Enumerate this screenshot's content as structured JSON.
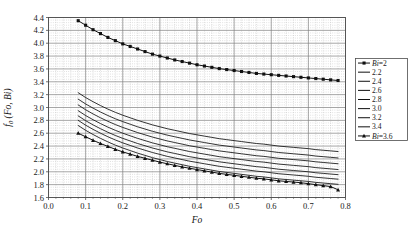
{
  "chart_data": {
    "type": "line",
    "title": "",
    "xlabel": "Fo",
    "ylabel": "f0 (Fo, Bi)",
    "xlim": [
      0.0,
      0.8
    ],
    "ylim": [
      1.6,
      4.4
    ],
    "xticks": [
      "0.0",
      "0.1",
      "0.2",
      "0.3",
      "0.4",
      "0.5",
      "0.6",
      "0.7",
      "0.8"
    ],
    "xtick_values": [
      0.0,
      0.1,
      0.2,
      0.3,
      0.4,
      0.5,
      0.6,
      0.7,
      0.8
    ],
    "yticks": [
      "1.6",
      "1.8",
      "2.0",
      "2.2",
      "2.4",
      "2.6",
      "2.8",
      "3.0",
      "3.2",
      "3.4",
      "3.6",
      "3.8",
      "4.0",
      "4.2",
      "4.4"
    ],
    "ytick_values": [
      1.6,
      1.8,
      2.0,
      2.2,
      2.4,
      2.6,
      2.8,
      3.0,
      3.2,
      3.4,
      3.6,
      3.8,
      4.0,
      4.2,
      4.4
    ],
    "grid": true,
    "grid_minor": true,
    "minor_divisions": 5,
    "legend_position": "outside-right",
    "x": [
      0.08,
      0.1,
      0.12,
      0.14,
      0.16,
      0.18,
      0.2,
      0.22,
      0.24,
      0.26,
      0.28,
      0.3,
      0.32,
      0.34,
      0.36,
      0.38,
      0.4,
      0.42,
      0.44,
      0.46,
      0.48,
      0.5,
      0.52,
      0.54,
      0.56,
      0.58,
      0.6,
      0.62,
      0.64,
      0.66,
      0.68,
      0.7,
      0.72,
      0.74,
      0.76,
      0.78
    ],
    "series": [
      {
        "name": "Bi=2",
        "legend_label": "Bi=2",
        "marker": "square",
        "values": [
          4.35,
          4.28,
          4.21,
          4.15,
          4.09,
          4.04,
          3.99,
          3.95,
          3.91,
          3.87,
          3.83,
          3.8,
          3.77,
          3.74,
          3.715,
          3.69,
          3.665,
          3.645,
          3.625,
          3.605,
          3.59,
          3.575,
          3.56,
          3.545,
          3.53,
          3.52,
          3.51,
          3.5,
          3.49,
          3.48,
          3.47,
          3.46,
          3.45,
          3.44,
          3.43,
          3.42
        ]
      },
      {
        "name": "2.2",
        "legend_label": "2.2",
        "marker": "none",
        "values": [
          3.23,
          3.155,
          3.09,
          3.03,
          2.975,
          2.925,
          2.88,
          2.84,
          2.8,
          2.765,
          2.73,
          2.7,
          2.67,
          2.645,
          2.62,
          2.595,
          2.575,
          2.555,
          2.535,
          2.515,
          2.5,
          2.485,
          2.47,
          2.455,
          2.44,
          2.43,
          2.415,
          2.4,
          2.39,
          2.38,
          2.37,
          2.36,
          2.345,
          2.335,
          2.325,
          2.315
        ]
      },
      {
        "name": "2.4",
        "legend_label": "2.4",
        "marker": "none",
        "values": [
          3.13,
          3.055,
          2.99,
          2.93,
          2.875,
          2.825,
          2.78,
          2.74,
          2.7,
          2.665,
          2.63,
          2.6,
          2.57,
          2.545,
          2.52,
          2.495,
          2.475,
          2.455,
          2.435,
          2.415,
          2.4,
          2.385,
          2.37,
          2.355,
          2.34,
          2.33,
          2.315,
          2.3,
          2.29,
          2.28,
          2.27,
          2.26,
          2.245,
          2.235,
          2.225,
          2.215
        ]
      },
      {
        "name": "2.6",
        "legend_label": "2.6",
        "marker": "none",
        "values": [
          3.04,
          2.965,
          2.9,
          2.84,
          2.785,
          2.735,
          2.69,
          2.65,
          2.61,
          2.575,
          2.54,
          2.51,
          2.48,
          2.455,
          2.43,
          2.405,
          2.385,
          2.365,
          2.345,
          2.325,
          2.31,
          2.295,
          2.28,
          2.265,
          2.25,
          2.24,
          2.225,
          2.21,
          2.2,
          2.19,
          2.18,
          2.17,
          2.155,
          2.145,
          2.135,
          2.125
        ]
      },
      {
        "name": "2.8",
        "legend_label": "2.8",
        "marker": "none",
        "values": [
          2.95,
          2.875,
          2.81,
          2.75,
          2.695,
          2.645,
          2.6,
          2.56,
          2.52,
          2.485,
          2.45,
          2.42,
          2.39,
          2.365,
          2.34,
          2.315,
          2.295,
          2.275,
          2.255,
          2.235,
          2.22,
          2.205,
          2.19,
          2.175,
          2.16,
          2.15,
          2.135,
          2.12,
          2.11,
          2.1,
          2.09,
          2.08,
          2.065,
          2.055,
          2.045,
          2.035
        ]
      },
      {
        "name": "3.0",
        "legend_label": "3.0",
        "marker": "none",
        "values": [
          2.87,
          2.795,
          2.73,
          2.67,
          2.615,
          2.565,
          2.52,
          2.48,
          2.44,
          2.405,
          2.37,
          2.34,
          2.31,
          2.285,
          2.26,
          2.235,
          2.215,
          2.195,
          2.175,
          2.155,
          2.14,
          2.125,
          2.11,
          2.095,
          2.08,
          2.07,
          2.055,
          2.04,
          2.03,
          2.02,
          2.01,
          2.0,
          1.985,
          1.975,
          1.965,
          1.955
        ]
      },
      {
        "name": "3.2",
        "legend_label": "3.2",
        "marker": "none",
        "values": [
          2.8,
          2.725,
          2.66,
          2.6,
          2.545,
          2.495,
          2.45,
          2.41,
          2.37,
          2.335,
          2.3,
          2.27,
          2.24,
          2.215,
          2.19,
          2.165,
          2.145,
          2.125,
          2.105,
          2.085,
          2.07,
          2.055,
          2.04,
          2.025,
          2.01,
          2.0,
          1.985,
          1.97,
          1.96,
          1.95,
          1.94,
          1.93,
          1.915,
          1.905,
          1.895,
          1.885
        ]
      },
      {
        "name": "3.4",
        "legend_label": "3.4",
        "marker": "none",
        "values": [
          2.72,
          2.645,
          2.58,
          2.52,
          2.465,
          2.415,
          2.37,
          2.33,
          2.29,
          2.255,
          2.22,
          2.19,
          2.16,
          2.135,
          2.11,
          2.085,
          2.065,
          2.045,
          2.025,
          2.005,
          1.99,
          1.975,
          1.96,
          1.945,
          1.93,
          1.92,
          1.905,
          1.89,
          1.88,
          1.87,
          1.86,
          1.85,
          1.835,
          1.825,
          1.815,
          1.805
        ]
      },
      {
        "name": "Bi=3.6",
        "legend_label": "Bi=3.6",
        "marker": "triangle",
        "values": [
          2.6,
          2.545,
          2.49,
          2.44,
          2.395,
          2.35,
          2.31,
          2.275,
          2.24,
          2.21,
          2.18,
          2.15,
          2.125,
          2.1,
          2.075,
          2.055,
          2.035,
          2.015,
          1.995,
          1.975,
          1.96,
          1.945,
          1.93,
          1.915,
          1.9,
          1.89,
          1.875,
          1.86,
          1.85,
          1.84,
          1.83,
          1.815,
          1.8,
          1.785,
          1.77,
          1.72
        ]
      }
    ]
  },
  "legend": {
    "items": [
      {
        "label": "Bi=2",
        "marker": "square",
        "italic_prefix": true
      },
      {
        "label": "2.2",
        "marker": "none",
        "italic_prefix": false
      },
      {
        "label": "2.4",
        "marker": "none",
        "italic_prefix": false
      },
      {
        "label": "2.6",
        "marker": "none",
        "italic_prefix": false
      },
      {
        "label": "2.8",
        "marker": "none",
        "italic_prefix": false
      },
      {
        "label": "3.0",
        "marker": "none",
        "italic_prefix": false
      },
      {
        "label": "3.2",
        "marker": "none",
        "italic_prefix": false
      },
      {
        "label": "3.4",
        "marker": "none",
        "italic_prefix": false
      },
      {
        "label": "Bi=3.6",
        "marker": "triangle",
        "italic_prefix": true
      }
    ]
  },
  "colors": {
    "line": "#101010",
    "axis": "#4d4d4d",
    "grid_major": "#808080",
    "grid_minor": "#b5b5b5",
    "background": "#ffffff",
    "text": "#1a1a1a"
  }
}
